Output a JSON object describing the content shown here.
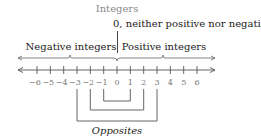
{
  "title": "Integers",
  "zero_note": "0, neither positive nor negative",
  "negative_label": "Negative integers",
  "positive_label": "Positive integers",
  "opposites_label": "Opposites",
  "number_line": {
    "ticks": [
      "−6",
      "−5",
      "−4",
      "−3",
      "−2",
      "−1",
      "0",
      "1",
      "2",
      "3",
      "4",
      "5",
      "6"
    ],
    "min": -6,
    "max": 6,
    "arrows": "both"
  },
  "opposite_pairs": [
    {
      "a": "−1",
      "b": "1"
    },
    {
      "a": "−2",
      "b": "2"
    },
    {
      "a": "−3",
      "b": "3"
    }
  ],
  "colors": {
    "title": "#8a8a8a",
    "text": "#222222",
    "line": "#555555",
    "tick_labels": "#777777"
  }
}
